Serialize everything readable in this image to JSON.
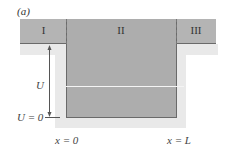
{
  "figure": {
    "panel_label": "(a)",
    "regions": [
      {
        "label": "I"
      },
      {
        "label": "II"
      },
      {
        "label": "III"
      }
    ],
    "energy_labels": {
      "depth": "U",
      "zero": "U = 0"
    },
    "position_labels": {
      "left_wall": "x = 0",
      "right_wall": "x = L"
    },
    "colors": {
      "band": "#b4b4b4",
      "well": "#adadad",
      "shadow": "#e9e9e9",
      "lines": "#6a6a6a"
    }
  }
}
